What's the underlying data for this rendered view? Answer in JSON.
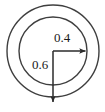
{
  "figure": {
    "name": "concentric-circles-radius-diagram",
    "background_color": "#ffffff",
    "stroke_color": "#3a3a3a",
    "text_color": "#1a1a1a",
    "center": {
      "x": 53,
      "y": 51
    },
    "circles": [
      {
        "name": "outer-circle",
        "radius_px": 46,
        "stroke_width": 1.4
      },
      {
        "name": "inner-circle",
        "radius_px": 34,
        "stroke_width": 1.4
      }
    ],
    "arrows": [
      {
        "name": "horizontal-radius-arrow",
        "direction": "right",
        "from": {
          "x": 53,
          "y": 51
        },
        "to": {
          "x": 87,
          "y": 51
        },
        "label": "0.4"
      },
      {
        "name": "vertical-radius-arrow",
        "direction": "down",
        "from": {
          "x": 53,
          "y": 51
        },
        "to": {
          "x": 53,
          "y": 104
        },
        "label": "0.6"
      }
    ],
    "labels": {
      "outer_radius": "0.4",
      "inner_radius": "0.6"
    }
  }
}
